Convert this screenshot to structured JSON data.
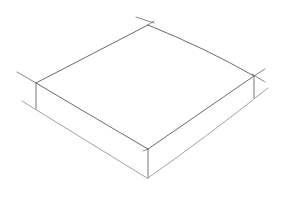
{
  "figure": {
    "title": "",
    "stroke_color": "#555555",
    "light_stroke_color": "#8a8a8a",
    "background": "#ffffff"
  }
}
